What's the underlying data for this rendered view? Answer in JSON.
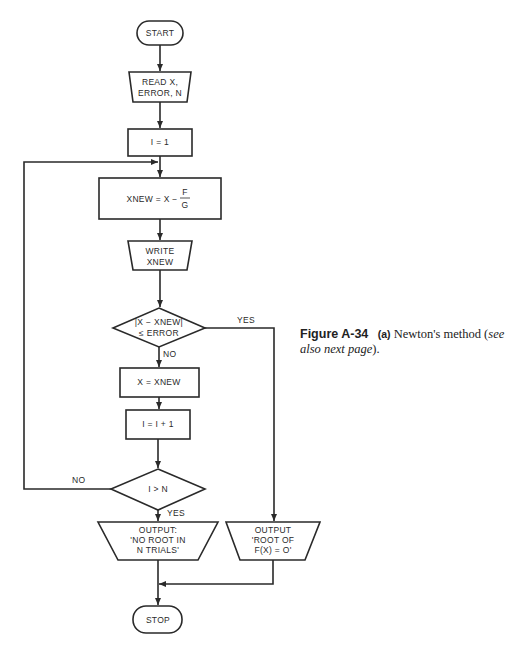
{
  "flowchart": {
    "start": "START",
    "read": [
      "READ X,",
      "ERROR, N"
    ],
    "init": "I = 1",
    "compute": {
      "lhs": "XNEW = X −",
      "num": "F",
      "den": "G"
    },
    "write": [
      "WRITE",
      "XNEW"
    ],
    "test1": [
      "|X − XNEW|",
      "≤ ERROR"
    ],
    "test1_yes": "YES",
    "test1_no": "NO",
    "assign": "X = XNEW",
    "increment": "I = I + 1",
    "test2": "I > N",
    "test2_yes": "YES",
    "test2_no": "NO",
    "output_fail": [
      "OUTPUT:",
      "'NO ROOT IN",
      "N TRIALS'"
    ],
    "output_success": [
      "OUTPUT",
      "'ROOT OF",
      "F(X) = O'"
    ],
    "stop": "STOP"
  },
  "caption": {
    "figure": "Figure A-34",
    "part": "(a)",
    "text": "Newton's method (",
    "italic": "see also next page",
    "end": ")."
  }
}
